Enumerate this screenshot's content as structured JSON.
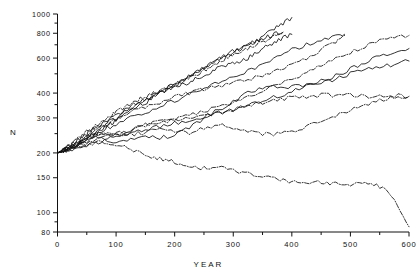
{
  "chart_data": {
    "type": "line",
    "title": "",
    "xlabel": "YEAR",
    "ylabel": "N",
    "yscale": "log",
    "xlim": [
      0,
      600
    ],
    "ylim": [
      80,
      1000
    ],
    "grid": false,
    "legend": "none",
    "xticks": [
      0,
      100,
      200,
      300,
      400,
      500,
      600
    ],
    "xticklabels": [
      "0",
      "100",
      "200",
      "300",
      "400",
      "500",
      "600"
    ],
    "xminorticks": [
      50,
      150,
      250,
      350,
      450,
      550
    ],
    "yticks": [
      80,
      100,
      150,
      200,
      300,
      400,
      600,
      800,
      1000
    ],
    "yticklabels": [
      "80",
      "100",
      "150",
      "200",
      "300",
      "400",
      "600",
      "800",
      "1000"
    ],
    "yminorticks": [
      90,
      250,
      350,
      500,
      700,
      900
    ],
    "series": [
      {
        "name": "trajectory-1",
        "style": "solid",
        "x": [
          0,
          10,
          20,
          30,
          40,
          50,
          60,
          70,
          80,
          90,
          100,
          115,
          130,
          145,
          160,
          175,
          190,
          205,
          220,
          235,
          250,
          265,
          280,
          295,
          310,
          325,
          340,
          355,
          370,
          385,
          400
        ],
        "y": [
          200,
          206,
          214,
          223,
          229,
          240,
          252,
          262,
          276,
          288,
          300,
          322,
          344,
          360,
          385,
          404,
          430,
          452,
          470,
          500,
          530,
          566,
          600,
          630,
          660,
          700,
          740,
          790,
          840,
          900,
          960
        ]
      },
      {
        "name": "trajectory-2",
        "style": "solid",
        "x": [
          0,
          10,
          20,
          30,
          40,
          50,
          60,
          70,
          80,
          90,
          100,
          115,
          130,
          145,
          160,
          175,
          190,
          205,
          220,
          235,
          250,
          265,
          280,
          295,
          310,
          325,
          340,
          355,
          370,
          385
        ],
        "y": [
          200,
          204,
          210,
          216,
          224,
          236,
          247,
          254,
          268,
          280,
          292,
          312,
          334,
          350,
          372,
          400,
          420,
          444,
          476,
          505,
          540,
          570,
          605,
          640,
          670,
          700,
          730,
          760,
          790,
          810
        ]
      },
      {
        "name": "trajectory-3",
        "style": "solid",
        "x": [
          0,
          10,
          20,
          30,
          40,
          50,
          60,
          70,
          80,
          90,
          100,
          115,
          130,
          145,
          160,
          175,
          190,
          205,
          220,
          235,
          250,
          265,
          280,
          295,
          310,
          325,
          340,
          355,
          370,
          385,
          400
        ],
        "y": [
          200,
          207,
          216,
          226,
          238,
          250,
          262,
          272,
          284,
          296,
          310,
          330,
          352,
          370,
          385,
          400,
          420,
          440,
          450,
          470,
          490,
          520,
          545,
          560,
          580,
          600,
          640,
          680,
          720,
          760,
          790
        ]
      },
      {
        "name": "trajectory-4",
        "style": "dashdot",
        "x": [
          0,
          10,
          20,
          30,
          40,
          50,
          60,
          70,
          80,
          90,
          100,
          115,
          130,
          145,
          160,
          175,
          190,
          205,
          220,
          235,
          250,
          265,
          280,
          295,
          310,
          325,
          340,
          355,
          370,
          385
        ],
        "y": [
          200,
          208,
          218,
          230,
          244,
          256,
          270,
          282,
          296,
          308,
          322,
          340,
          360,
          378,
          396,
          410,
          430,
          448,
          468,
          490,
          520,
          548,
          580,
          610,
          640,
          670,
          700,
          740,
          775,
          800
        ]
      },
      {
        "name": "trajectory-5",
        "style": "dashdot",
        "x": [
          0,
          20,
          40,
          60,
          80,
          100,
          125,
          150,
          175,
          200,
          225,
          250,
          275,
          300,
          325,
          350,
          375,
          400,
          425,
          450,
          475,
          490
        ],
        "y": [
          200,
          212,
          232,
          255,
          275,
          296,
          320,
          340,
          360,
          385,
          400,
          420,
          435,
          450,
          470,
          495,
          520,
          560,
          600,
          660,
          720,
          780
        ]
      },
      {
        "name": "trajectory-6",
        "style": "solid",
        "x": [
          0,
          20,
          40,
          60,
          80,
          100,
          125,
          150,
          175,
          200,
          225,
          250,
          275,
          300,
          325,
          350,
          375,
          400,
          425,
          450,
          475,
          490
        ],
        "y": [
          200,
          210,
          226,
          244,
          262,
          280,
          300,
          320,
          345,
          365,
          395,
          420,
          450,
          480,
          520,
          560,
          610,
          660,
          700,
          740,
          780,
          790
        ]
      },
      {
        "name": "trajectory-7",
        "style": "solid",
        "x": [
          0,
          20,
          40,
          60,
          80,
          100,
          125,
          150,
          175,
          200,
          225,
          250,
          275,
          300,
          325,
          350,
          375,
          400,
          425,
          450,
          475,
          500,
          525,
          550,
          575,
          600
        ],
        "y": [
          200,
          206,
          214,
          222,
          232,
          240,
          252,
          262,
          272,
          282,
          292,
          305,
          318,
          330,
          348,
          366,
          386,
          406,
          430,
          460,
          490,
          530,
          570,
          610,
          645,
          670
        ]
      },
      {
        "name": "trajectory-8",
        "style": "dashdot",
        "x": [
          0,
          20,
          40,
          60,
          80,
          100,
          125,
          150,
          175,
          200,
          225,
          250,
          275,
          300,
          325,
          350,
          375,
          400,
          425,
          450,
          475,
          500,
          525,
          550,
          575,
          600
        ],
        "y": [
          200,
          208,
          218,
          228,
          238,
          248,
          260,
          272,
          282,
          295,
          308,
          322,
          340,
          360,
          385,
          410,
          440,
          470,
          505,
          545,
          590,
          640,
          690,
          730,
          760,
          780
        ]
      },
      {
        "name": "trajectory-9",
        "style": "solid",
        "x": [
          0,
          20,
          40,
          60,
          80,
          100,
          125,
          150,
          175,
          200,
          225,
          250,
          275,
          300,
          325,
          350,
          375,
          400,
          425,
          450,
          475,
          500,
          525,
          550,
          575,
          600
        ],
        "y": [
          200,
          212,
          226,
          240,
          232,
          224,
          232,
          240,
          238,
          246,
          268,
          300,
          330,
          360,
          400,
          420,
          430,
          430,
          440,
          450,
          470,
          500,
          520,
          540,
          560,
          580
        ]
      },
      {
        "name": "trajectory-10",
        "style": "dashdot",
        "x": [
          0,
          20,
          40,
          60,
          80,
          100,
          125,
          150,
          175,
          200,
          225,
          250,
          275,
          300,
          325,
          350,
          375,
          400,
          425,
          450,
          475,
          500,
          525,
          550,
          575,
          600
        ],
        "y": [
          200,
          214,
          230,
          244,
          250,
          248,
          262,
          276,
          290,
          296,
          300,
          306,
          316,
          330,
          346,
          360,
          372,
          380,
          385,
          390,
          390,
          388,
          386,
          388,
          388,
          385
        ]
      },
      {
        "name": "trajectory-11",
        "style": "dashdot",
        "x": [
          0,
          20,
          40,
          60,
          80,
          100,
          125,
          150,
          175,
          200,
          225,
          250,
          275,
          300,
          325,
          350,
          375,
          400,
          425,
          450,
          475,
          500,
          525,
          550,
          575,
          600
        ],
        "y": [
          200,
          210,
          222,
          236,
          248,
          250,
          248,
          252,
          270,
          258,
          252,
          266,
          280,
          270,
          258,
          248,
          250,
          256,
          270,
          288,
          310,
          330,
          352,
          370,
          378,
          382
        ]
      },
      {
        "name": "trajectory-12",
        "style": "dashdot",
        "x": [
          0,
          20,
          40,
          60,
          80,
          100,
          120,
          140,
          160,
          180,
          200,
          220,
          240,
          260,
          280,
          300,
          320,
          340,
          360,
          380,
          400,
          420,
          440,
          460,
          480,
          500,
          520,
          540,
          560,
          580,
          600
        ],
        "y": [
          200,
          206,
          214,
          224,
          228,
          222,
          212,
          200,
          192,
          186,
          180,
          174,
          166,
          170,
          168,
          164,
          158,
          152,
          150,
          148,
          142,
          140,
          144,
          140,
          142,
          138,
          144,
          140,
          130,
          110,
          85
        ]
      }
    ]
  }
}
